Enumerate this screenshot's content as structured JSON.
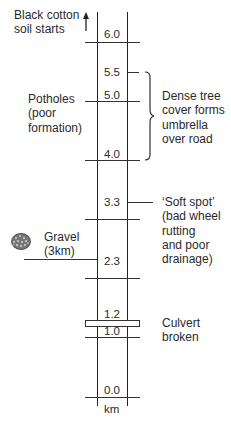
{
  "diagram": {
    "type": "road strip map",
    "unit_label": "km",
    "chainage_markers": [
      {
        "label": "6.0",
        "km": 6.0
      },
      {
        "label": "5.5",
        "km": 5.5
      },
      {
        "label": "5.0",
        "km": 5.0
      },
      {
        "label": "4.0",
        "km": 4.0
      },
      {
        "label": "3.3",
        "km": 3.3
      },
      {
        "label": "2.3",
        "km": 2.3
      },
      {
        "label": "1.2",
        "km": 1.2
      },
      {
        "label": "1.0",
        "km": 1.0
      },
      {
        "label": "0.0",
        "km": 0.0
      }
    ],
    "annotations": {
      "black_cotton": "Black cotton\nsoil starts",
      "potholes": "Potholes\n(poor\nformation)",
      "dense_tree": "Dense tree\ncover forms\numbrella\nover road",
      "soft_spot": "‘Soft spot’\n(bad wheel\nrutting\nand poor\ndrainage)",
      "gravel": "Gravel\n(3km)",
      "culvert": "Culvert\nbroken"
    },
    "icons": {
      "arrow": "arrow-up-icon",
      "gravel": "gravel-pile-icon",
      "brace": "curly-brace"
    }
  }
}
